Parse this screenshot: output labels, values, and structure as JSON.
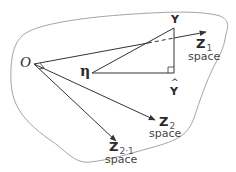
{
  "diagram": {
    "origin_label": "O",
    "eta_label": "η",
    "y_label": "Y",
    "yhat_label": "Y",
    "yhat_accent": "^",
    "z1": {
      "symbol": "Z",
      "subscript": "1",
      "caption": "space"
    },
    "z2": {
      "symbol": "Z",
      "subscript": "2",
      "caption": "space"
    },
    "z21": {
      "symbol": "Z",
      "subscript": "2·1",
      "caption": "space"
    }
  },
  "colors": {
    "stroke": "#333333",
    "boundary": "#999999",
    "text": "#2a2a2a"
  }
}
